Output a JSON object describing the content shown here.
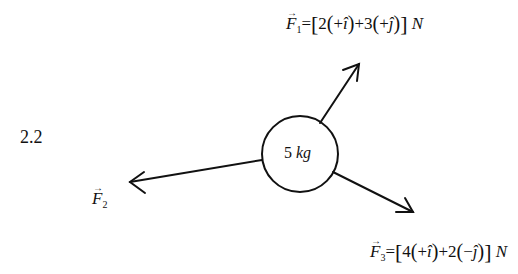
{
  "problem": {
    "number": "2.2"
  },
  "object": {
    "mass_value": "5",
    "mass_unit": "kg",
    "shape": "circle",
    "center": [
      300,
      154
    ],
    "radius": 38
  },
  "forces": [
    {
      "name": "F1",
      "symbol": "F",
      "subscript": "1",
      "equals": "=",
      "open_bracket": "[",
      "c1": "2",
      "sign1": "+",
      "unit1": "î",
      "joiner": "+",
      "c2": "3",
      "sign2": "+",
      "unit2": "ĵ",
      "close_bracket": "]",
      "unit": "N",
      "arrow": {
        "from": [
          320,
          123
        ],
        "to": [
          359,
          64
        ]
      }
    },
    {
      "name": "F2",
      "symbol": "F",
      "subscript": "2",
      "arrow": {
        "from": [
          262,
          160
        ],
        "to": [
          130,
          182
        ]
      }
    },
    {
      "name": "F3",
      "symbol": "F",
      "subscript": "3",
      "equals": "=",
      "open_bracket": "[",
      "c1": "4",
      "sign1": "+",
      "unit1": "î",
      "joiner": "+",
      "c2": "2",
      "sign2": "−",
      "unit2": "ĵ",
      "close_bracket": "]",
      "unit": "N",
      "arrow": {
        "from": [
          333,
          172
        ],
        "to": [
          413,
          212
        ]
      }
    }
  ],
  "vector_arrow_glyph": "→",
  "colors": {
    "ink": "#111111",
    "background": "#ffffff"
  }
}
